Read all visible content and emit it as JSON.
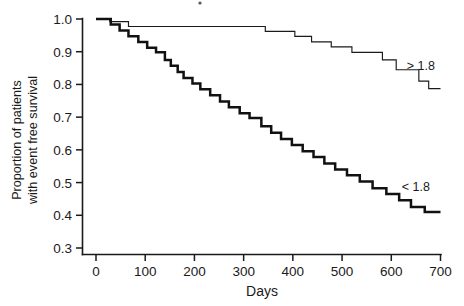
{
  "chart_data": {
    "type": "line",
    "title": "",
    "xlabel": "Days",
    "ylabel": "Proportion of patients with event free survival",
    "ylabel_line1": "Proportion of patients",
    "ylabel_line2": "with event free survival",
    "xlim": [
      0,
      700
    ],
    "ylim": [
      0.3,
      1.0
    ],
    "xticks": [
      0,
      100,
      200,
      300,
      400,
      500,
      600,
      700
    ],
    "xtick_labels": [
      "0",
      "100",
      "200",
      "300",
      "400",
      "500",
      "600",
      "700"
    ],
    "yticks": [
      0.3,
      0.4,
      0.5,
      0.6,
      0.7,
      0.8,
      0.9,
      1.0
    ],
    "ytick_labels": [
      "0.3",
      "0.4",
      "0.5",
      "0.6",
      "0.7",
      "0.8",
      "0.9",
      "1.0"
    ],
    "grid": false,
    "legend_position": "inline-annotation",
    "annotations": [
      {
        "text": "> 1.8",
        "x": 660,
        "y": 0.845,
        "series": "greater-than-1.8"
      },
      {
        "text": "< 1.8",
        "x": 650,
        "y": 0.475,
        "series": "less-than-1.8"
      }
    ],
    "series": [
      {
        "name": "> 1.8",
        "style": "thin",
        "label": "> 1.8",
        "steps": [
          [
            0,
            1.0
          ],
          [
            28,
            1.0
          ],
          [
            28,
            0.992
          ],
          [
            66,
            0.992
          ],
          [
            66,
            0.977
          ],
          [
            344,
            0.977
          ],
          [
            344,
            0.962
          ],
          [
            404,
            0.962
          ],
          [
            404,
            0.947
          ],
          [
            438,
            0.947
          ],
          [
            438,
            0.93
          ],
          [
            478,
            0.93
          ],
          [
            478,
            0.915
          ],
          [
            520,
            0.915
          ],
          [
            520,
            0.898
          ],
          [
            582,
            0.898
          ],
          [
            582,
            0.875
          ],
          [
            610,
            0.875
          ],
          [
            610,
            0.845
          ],
          [
            656,
            0.845
          ],
          [
            656,
            0.81
          ],
          [
            676,
            0.81
          ],
          [
            676,
            0.787
          ],
          [
            700,
            0.787
          ]
        ]
      },
      {
        "name": "< 1.8",
        "style": "thick",
        "label": "< 1.8",
        "steps": [
          [
            0,
            1.0
          ],
          [
            30,
            1.0
          ],
          [
            30,
            0.983
          ],
          [
            48,
            0.983
          ],
          [
            48,
            0.965
          ],
          [
            66,
            0.965
          ],
          [
            66,
            0.947
          ],
          [
            86,
            0.947
          ],
          [
            86,
            0.93
          ],
          [
            104,
            0.93
          ],
          [
            104,
            0.912
          ],
          [
            122,
            0.912
          ],
          [
            122,
            0.898
          ],
          [
            140,
            0.898
          ],
          [
            140,
            0.875
          ],
          [
            152,
            0.875
          ],
          [
            152,
            0.857
          ],
          [
            166,
            0.857
          ],
          [
            166,
            0.838
          ],
          [
            178,
            0.838
          ],
          [
            178,
            0.82
          ],
          [
            196,
            0.82
          ],
          [
            196,
            0.803
          ],
          [
            212,
            0.803
          ],
          [
            212,
            0.785
          ],
          [
            232,
            0.785
          ],
          [
            232,
            0.767
          ],
          [
            252,
            0.767
          ],
          [
            252,
            0.748
          ],
          [
            270,
            0.748
          ],
          [
            270,
            0.73
          ],
          [
            292,
            0.73
          ],
          [
            292,
            0.712
          ],
          [
            312,
            0.712
          ],
          [
            312,
            0.697
          ],
          [
            336,
            0.697
          ],
          [
            336,
            0.672
          ],
          [
            356,
            0.672
          ],
          [
            356,
            0.652
          ],
          [
            376,
            0.652
          ],
          [
            376,
            0.633
          ],
          [
            398,
            0.633
          ],
          [
            398,
            0.615
          ],
          [
            420,
            0.615
          ],
          [
            420,
            0.596
          ],
          [
            442,
            0.596
          ],
          [
            442,
            0.578
          ],
          [
            464,
            0.578
          ],
          [
            464,
            0.558
          ],
          [
            486,
            0.558
          ],
          [
            486,
            0.54
          ],
          [
            510,
            0.54
          ],
          [
            510,
            0.522
          ],
          [
            536,
            0.522
          ],
          [
            536,
            0.503
          ],
          [
            562,
            0.503
          ],
          [
            562,
            0.483
          ],
          [
            590,
            0.483
          ],
          [
            590,
            0.465
          ],
          [
            616,
            0.465
          ],
          [
            616,
            0.446
          ],
          [
            640,
            0.446
          ],
          [
            640,
            0.425
          ],
          [
            668,
            0.425
          ],
          [
            668,
            0.41
          ],
          [
            700,
            0.41
          ]
        ]
      }
    ]
  }
}
